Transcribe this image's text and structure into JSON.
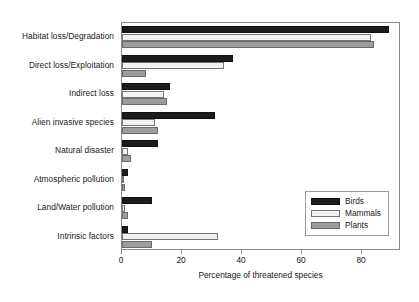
{
  "chart_data": {
    "type": "bar",
    "orientation": "horizontal",
    "title": "",
    "xlabel": "Percentage of threatened species",
    "ylabel": "",
    "xlim": [
      0,
      93
    ],
    "xticks": [
      0,
      20,
      40,
      60,
      80
    ],
    "xtick_labels": [
      "0",
      "20",
      "40",
      "60",
      "80"
    ],
    "grid": false,
    "legend_position": "lower right",
    "categories": [
      "Habitat loss/Degradation",
      "Direct loss/Exploitation",
      "Indirect loss",
      "Alien invasive species",
      "Natural disaster",
      "Atmospheric pollution",
      "Land/Water pollution",
      "Intrinsic factors"
    ],
    "series": [
      {
        "name": "Birds",
        "color": "#1c1c1c",
        "values": [
          89,
          37,
          16,
          31,
          12,
          2,
          10,
          2
        ]
      },
      {
        "name": "Mammals",
        "color": "#f2f2f2",
        "values": [
          83,
          34,
          14,
          11,
          2,
          0.5,
          1,
          32
        ]
      },
      {
        "name": "Plants",
        "color": "#9d9d9d",
        "values": [
          84,
          8,
          15,
          12,
          3,
          1,
          2,
          10
        ]
      }
    ]
  },
  "legend": {
    "items": [
      {
        "label": "Birds",
        "color": "#1c1c1c"
      },
      {
        "label": "Mammals",
        "color": "#f2f2f2"
      },
      {
        "label": "Plants",
        "color": "#9d9d9d"
      }
    ]
  },
  "labels": {
    "cat0": "Habitat loss/Degradation",
    "cat1": "Direct loss/Exploitation",
    "cat2": "Indirect loss",
    "cat3": "Alien invasive species",
    "cat4": "Natural disaster",
    "cat5": "Atmospheric pollution",
    "cat6": "Land/Water pollution",
    "cat7": "Intrinsic factors",
    "tick0": "0",
    "tick1": "20",
    "tick2": "40",
    "tick3": "60",
    "tick4": "80",
    "xaxis_title": "Percentage of threatened species",
    "legend0": "Birds",
    "legend1": "Mammals",
    "legend2": "Plants"
  }
}
